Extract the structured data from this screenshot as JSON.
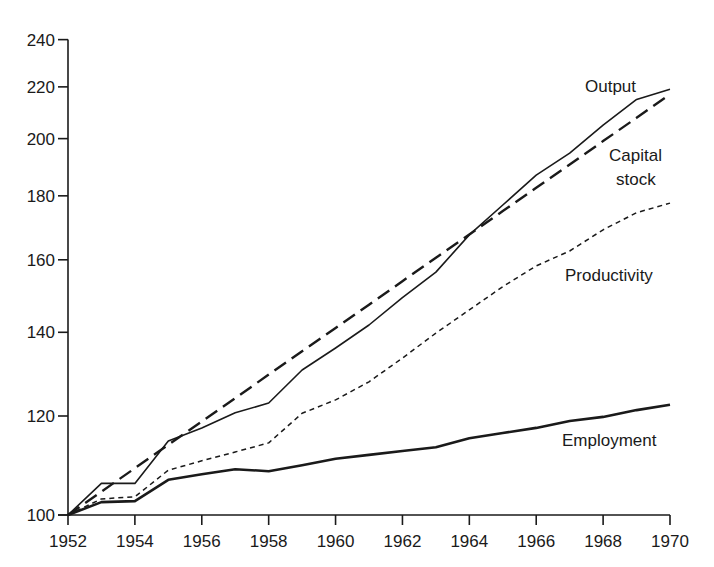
{
  "chart_data": {
    "type": "line",
    "title": "",
    "xlabel": "",
    "ylabel": "",
    "y_scale": "log",
    "ylim": [
      100,
      240
    ],
    "xlim": [
      1952,
      1970
    ],
    "grid": false,
    "legend_position": "inline-right",
    "x_ticks": [
      1952,
      1954,
      1956,
      1958,
      1960,
      1962,
      1964,
      1966,
      1968,
      1970
    ],
    "y_ticks": [
      100,
      120,
      140,
      160,
      180,
      200,
      220,
      240
    ],
    "x": [
      1952,
      1953,
      1954,
      1955,
      1956,
      1957,
      1958,
      1959,
      1960,
      1961,
      1962,
      1963,
      1964,
      1965,
      1966,
      1967,
      1968,
      1969,
      1970
    ],
    "series": [
      {
        "name": "Output",
        "style": "solid-thin",
        "values": [
          100,
          106,
          106,
          114.6,
          117.4,
          120.7,
          122.9,
          130.6,
          136,
          141.9,
          149.2,
          156.4,
          167.5,
          177,
          187,
          194.7,
          205,
          215,
          219
        ]
      },
      {
        "name": "Capital stock",
        "style": "long-dash",
        "values": [
          100,
          104.4,
          109.0,
          113.8,
          118.8,
          124.0,
          129.5,
          135.2,
          141.1,
          147.3,
          153.8,
          160.6,
          167.6,
          175.0,
          182.7,
          190.7,
          199.1,
          207.8,
          217
        ]
      },
      {
        "name": "Productivity",
        "style": "short-dash",
        "values": [
          100,
          103,
          103.4,
          108.6,
          110.5,
          112.3,
          114.2,
          120.6,
          123.6,
          127.8,
          133.5,
          139.8,
          145.9,
          152.3,
          158.2,
          162.6,
          169.1,
          174.5,
          177.6
        ]
      },
      {
        "name": "Employment",
        "style": "solid-thick",
        "values": [
          100,
          102.4,
          102.6,
          106.7,
          107.8,
          108.8,
          108.4,
          109.6,
          110.9,
          111.7,
          112.5,
          113.3,
          115.2,
          116.3,
          117.4,
          118.9,
          119.8,
          121.3,
          122.5
        ]
      }
    ],
    "annotations": [
      {
        "text": "Output",
        "series": "Output"
      },
      {
        "text": "Capital",
        "series": "Capital stock"
      },
      {
        "text": "stock",
        "series": "Capital stock"
      },
      {
        "text": "Productivity",
        "series": "Productivity"
      },
      {
        "text": "Employment",
        "series": "Employment"
      }
    ]
  },
  "labels": {
    "output": "Output",
    "capital_line1": "Capital",
    "capital_line2": "stock",
    "productivity": "Productivity",
    "employment": "Employment"
  },
  "colors": {
    "ink": "#1a1a1a",
    "background": "#ffffff"
  }
}
